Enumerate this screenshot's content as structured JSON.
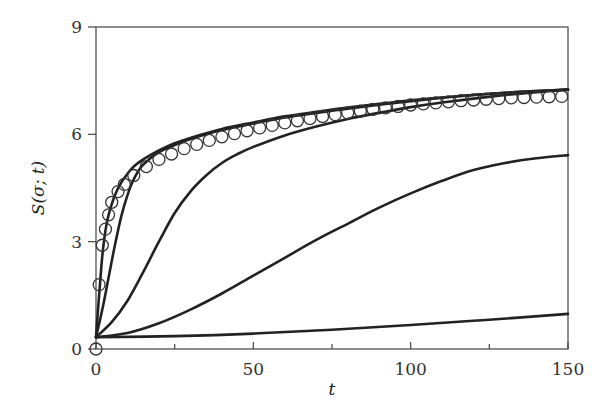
{
  "chart_data": {
    "type": "line",
    "title": "",
    "xlabel": "t",
    "ylabel": "S(σ; t)",
    "xlim": [
      0,
      150
    ],
    "ylim": [
      0,
      9
    ],
    "grid": false,
    "legend": null,
    "x_ticks": [
      0,
      50,
      100,
      150
    ],
    "x_tick_labels": [
      "0",
      "50",
      "100",
      "150"
    ],
    "x_minor_ticks": [
      25,
      75,
      125
    ],
    "y_ticks": [
      0,
      3,
      6,
      9
    ],
    "y_tick_labels": [
      "0",
      "3",
      "6",
      "9"
    ],
    "series": [
      {
        "name": "curve-1 (fastest)",
        "style": "line",
        "x": [
          0,
          1,
          2,
          3,
          4,
          6,
          8,
          10,
          12,
          15,
          20,
          25,
          30,
          40,
          50,
          60,
          70,
          80,
          90,
          100,
          110,
          120,
          130,
          140,
          150
        ],
        "y": [
          0.33,
          1.5,
          2.6,
          3.3,
          3.75,
          4.3,
          4.65,
          4.9,
          5.1,
          5.3,
          5.55,
          5.75,
          5.9,
          6.15,
          6.33,
          6.5,
          6.63,
          6.75,
          6.85,
          6.95,
          7.03,
          7.1,
          7.16,
          7.21,
          7.25
        ]
      },
      {
        "name": "curve-2",
        "style": "line",
        "x": [
          0,
          2,
          4,
          6,
          8,
          10,
          12,
          15,
          20,
          25,
          30,
          40,
          50,
          60,
          70,
          80,
          90,
          100,
          110,
          120,
          130,
          140,
          150
        ],
        "y": [
          0.33,
          1.1,
          2.0,
          2.9,
          3.7,
          4.3,
          4.75,
          5.15,
          5.5,
          5.7,
          5.87,
          6.12,
          6.3,
          6.47,
          6.6,
          6.72,
          6.83,
          6.93,
          7.02,
          7.1,
          7.16,
          7.21,
          7.25
        ]
      },
      {
        "name": "curve-3",
        "style": "line",
        "x": [
          0,
          5,
          10,
          15,
          20,
          25,
          30,
          35,
          40,
          45,
          50,
          60,
          70,
          80,
          90,
          100,
          110,
          120,
          130,
          140,
          150
        ],
        "y": [
          0.33,
          0.75,
          1.35,
          2.15,
          3.0,
          3.8,
          4.4,
          4.85,
          5.2,
          5.45,
          5.65,
          5.97,
          6.22,
          6.43,
          6.6,
          6.76,
          6.89,
          7.0,
          7.1,
          7.18,
          7.25
        ]
      },
      {
        "name": "curve-4",
        "style": "line",
        "x": [
          0,
          10,
          20,
          30,
          40,
          50,
          60,
          70,
          80,
          90,
          100,
          110,
          120,
          130,
          140,
          150
        ],
        "y": [
          0.33,
          0.45,
          0.72,
          1.1,
          1.55,
          2.05,
          2.55,
          3.05,
          3.5,
          3.95,
          4.35,
          4.7,
          5.0,
          5.2,
          5.33,
          5.42
        ]
      },
      {
        "name": "curve-5 (slowest)",
        "style": "line",
        "x": [
          0,
          25,
          50,
          75,
          100,
          125,
          150
        ],
        "y": [
          0.33,
          0.36,
          0.43,
          0.54,
          0.67,
          0.82,
          0.98
        ]
      },
      {
        "name": "data (circles)",
        "style": "marker-circle",
        "x": [
          0,
          1,
          2,
          3,
          4,
          5,
          7,
          9,
          12,
          16,
          20,
          24,
          28,
          32,
          36,
          40,
          44,
          48,
          52,
          56,
          60,
          64,
          68,
          72,
          76,
          80,
          84,
          88,
          92,
          96,
          100,
          104,
          108,
          112,
          116,
          120,
          124,
          128,
          132,
          136,
          140,
          144,
          148
        ],
        "y": [
          0,
          1.8,
          2.9,
          3.35,
          3.75,
          4.1,
          4.4,
          4.6,
          4.85,
          5.1,
          5.3,
          5.45,
          5.6,
          5.72,
          5.83,
          5.93,
          6.02,
          6.1,
          6.18,
          6.25,
          6.32,
          6.38,
          6.44,
          6.5,
          6.55,
          6.6,
          6.65,
          6.7,
          6.74,
          6.78,
          6.82,
          6.85,
          6.88,
          6.91,
          6.94,
          6.96,
          6.98,
          7.0,
          7.02,
          7.03,
          7.04,
          7.05,
          7.06
        ]
      }
    ]
  },
  "plot_area": {
    "left": 96,
    "right": 568,
    "top": 27,
    "bottom": 349
  },
  "colors": {
    "line": "#222222",
    "frame": "#444444",
    "text": "#333333",
    "background": "#ffffff"
  }
}
